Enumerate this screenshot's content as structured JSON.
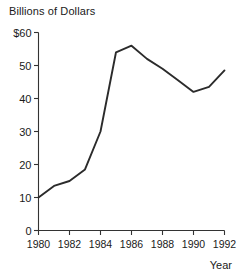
{
  "chart_data": {
    "type": "line",
    "title": "Billions of Dollars",
    "xlabel": "Year",
    "ylabel": "",
    "x": [
      1980,
      1981,
      1982,
      1983,
      1984,
      1985,
      1986,
      1987,
      1988,
      1989,
      1990,
      1991,
      1992
    ],
    "values": [
      10,
      13.5,
      15,
      18.5,
      30,
      54,
      56,
      52,
      49,
      45.5,
      42,
      43.5,
      48.5
    ],
    "series": [
      {
        "name": "Billions of Dollars",
        "values": [
          10,
          13.5,
          15,
          18.5,
          30,
          54,
          56,
          52,
          49,
          45.5,
          42,
          43.5,
          48.5
        ]
      }
    ],
    "xlim": [
      1980,
      1992
    ],
    "ylim": [
      0,
      60
    ],
    "ytick_labels": [
      "$60",
      "50",
      "40",
      "30",
      "20",
      "10",
      "0"
    ],
    "ytick_values": [
      60,
      50,
      40,
      30,
      20,
      10,
      0
    ],
    "xtick_labels": [
      "1980",
      "1982",
      "1984",
      "1986",
      "1988",
      "1990",
      "1992"
    ],
    "xtick_values": [
      1980,
      1982,
      1984,
      1986,
      1988,
      1990,
      1992
    ],
    "grid": false,
    "legend": false,
    "line_color": "#2b2b2b",
    "axis_color": "#333333"
  },
  "chart": {
    "title": "Billions of Dollars",
    "x_axis_title": "Year"
  }
}
